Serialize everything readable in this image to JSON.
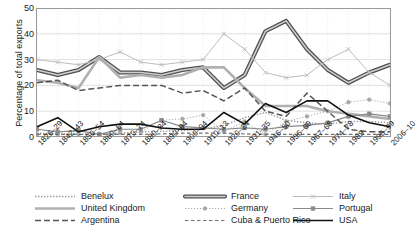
{
  "chart_data": {
    "type": "line",
    "title": "",
    "xlabel": "",
    "ylabel": "Percentage of total exports",
    "ylim": [
      0,
      50
    ],
    "yticks": [
      0,
      10,
      20,
      30,
      40,
      50
    ],
    "grid": true,
    "legend_position": "bottom",
    "categories": [
      "1826–29",
      "1842–43",
      "1850–54",
      "1860–64",
      "1870–74",
      "1880–84",
      "1890–94",
      "1900–04",
      "1910–13",
      "1920–24",
      "1931–35",
      "1946–50",
      "1956–60",
      "1967–68",
      "1974–78",
      "1989",
      "1995–99",
      "2006–10"
    ],
    "series": [
      {
        "name": "Benelux",
        "color": "#9a9a9a",
        "style": "dotted",
        "marker": "none",
        "values": [
          1.5,
          1.2,
          1.0,
          1.2,
          1.5,
          2.0,
          2.2,
          2.5,
          3.0,
          4.5,
          7.5,
          9.5,
          6.5,
          5.5,
          5.0,
          6.0,
          6.0,
          5.5
        ]
      },
      {
        "name": "France",
        "color": "#6f6f6f",
        "style": "thick-double",
        "marker": "none",
        "values": [
          26,
          24,
          26,
          31,
          25,
          25,
          24,
          26,
          27,
          19,
          24,
          41,
          45,
          34,
          26,
          21,
          25,
          28
        ]
      },
      {
        "name": "Italy",
        "color": "#bdbdbd",
        "style": "solid",
        "marker": "cross",
        "values": [
          30,
          29,
          28,
          30,
          33,
          29,
          28,
          29,
          30,
          40,
          34,
          25,
          23,
          24,
          30,
          34,
          25,
          20
        ]
      },
      {
        "name": "United Kingdom",
        "color": "#b0b0b0",
        "style": "solid-thick",
        "marker": "none",
        "values": [
          22,
          21,
          19,
          31,
          23,
          24,
          23,
          24,
          27,
          27,
          19,
          12,
          12,
          12,
          10,
          9,
          8,
          7
        ]
      },
      {
        "name": "Germany",
        "color": "#a8a8a8",
        "style": "dotted-marker",
        "marker": "circle",
        "values": [
          1.0,
          1.0,
          1.0,
          1.2,
          1.5,
          2.0,
          6.5,
          7.0,
          8.5,
          2.0,
          6.0,
          1.0,
          6.0,
          8.0,
          10.0,
          13.5,
          14.5,
          13.0
        ]
      },
      {
        "name": "Portugal",
        "color": "#8a8a8a",
        "style": "solid-marker",
        "marker": "square",
        "values": [
          3.0,
          2.0,
          2.5,
          1.0,
          3.0,
          3.0,
          6.5,
          4.0,
          3.5,
          3.0,
          3.5,
          3.0,
          4.0,
          4.5,
          5.5,
          8.0,
          9.0,
          8.0
        ]
      },
      {
        "name": "Argentina",
        "color": "#555555",
        "style": "dashed-long",
        "marker": "none",
        "values": [
          21,
          22,
          18,
          19,
          20,
          20,
          20,
          17,
          18,
          14,
          19,
          10,
          8,
          17,
          10,
          3,
          2,
          2
        ]
      },
      {
        "name": "Cuba & Puerto Rico",
        "color": "#707070",
        "style": "dashed-short",
        "marker": "none",
        "values": [
          1.0,
          1.0,
          1.0,
          1.0,
          1.0,
          1.0,
          1.2,
          1.5,
          1.5,
          1.5,
          1.2,
          1.0,
          1.0,
          1.0,
          1.0,
          1.0,
          1.0,
          1.0
        ]
      },
      {
        "name": "USA",
        "color": "#111111",
        "style": "solid-black",
        "marker": "none",
        "values": [
          4.0,
          7.5,
          2.0,
          4.0,
          5.0,
          5.0,
          3.5,
          3.0,
          3.0,
          9.5,
          5.0,
          13.0,
          9.5,
          14.0,
          14.0,
          8.5,
          5.5,
          4.0
        ]
      }
    ]
  },
  "legend": {
    "columns": [
      [
        {
          "label": "Benelux",
          "key": "benelux"
        },
        {
          "label": "United Kingdom",
          "key": "united-kingdom"
        },
        {
          "label": "Argentina",
          "key": "argentina"
        }
      ],
      [
        {
          "label": "France",
          "key": "france"
        },
        {
          "label": "Germany",
          "key": "germany"
        },
        {
          "label": "Cuba & Puerto Rico",
          "key": "cuba-puerto-rico"
        }
      ],
      [
        {
          "label": "Italy",
          "key": "italy"
        },
        {
          "label": "Portugal",
          "key": "portugal"
        },
        {
          "label": "USA",
          "key": "usa"
        }
      ]
    ]
  }
}
